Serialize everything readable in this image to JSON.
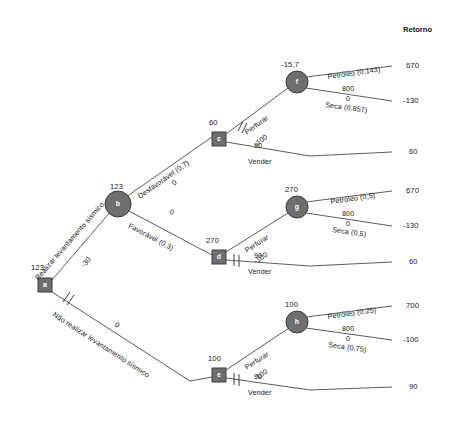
{
  "header": {
    "returns_label": "Retorno"
  },
  "nodes": [
    {
      "id": "a",
      "letter": "a",
      "type": "decision",
      "value": "123",
      "x": 45,
      "y": 285
    },
    {
      "id": "b",
      "letter": "b",
      "type": "chance",
      "value": "123",
      "x": 118,
      "y": 204
    },
    {
      "id": "c",
      "letter": "c",
      "type": "decision",
      "value": "60",
      "x": 219,
      "y": 139
    },
    {
      "id": "d",
      "letter": "d",
      "type": "decision",
      "value": "270",
      "x": 219,
      "y": 257
    },
    {
      "id": "e",
      "letter": "e",
      "type": "decision",
      "value": "100",
      "x": 219,
      "y": 375
    },
    {
      "id": "f",
      "letter": "f",
      "type": "chance",
      "value": "-15,7",
      "x": 297,
      "y": 82
    },
    {
      "id": "g",
      "letter": "g",
      "type": "chance",
      "value": "270",
      "x": 297,
      "y": 207
    },
    {
      "id": "h",
      "letter": "h",
      "type": "chance",
      "value": "100",
      "x": 297,
      "y": 322
    }
  ],
  "branches": [
    {
      "id": "a-b",
      "label": "Realizar levantamento sísmico",
      "cost": "-30",
      "pruned": false
    },
    {
      "id": "a-e",
      "label": "Não realizar levantamento sísmico",
      "cost": "0",
      "pruned": true
    },
    {
      "id": "b-c",
      "label": "Desfavorável (0,7)",
      "cost": "0",
      "pruned": false
    },
    {
      "id": "b-d",
      "label": "Favorável (0,3)",
      "cost": "0",
      "pruned": false
    },
    {
      "id": "c-f",
      "label": "Perfurar",
      "cost": "-100",
      "pruned": true
    },
    {
      "id": "c-t3",
      "label": "Vender",
      "cost": "90",
      "pruned": false
    },
    {
      "id": "d-g",
      "label": "Perfurar",
      "cost": "-100",
      "pruned": false
    },
    {
      "id": "d-t6",
      "label": "Vender",
      "cost": "90",
      "pruned": true
    },
    {
      "id": "e-h",
      "label": "Perfurar",
      "cost": "-100",
      "pruned": false
    },
    {
      "id": "e-t9",
      "label": "Vender",
      "cost": "90",
      "pruned": true
    },
    {
      "id": "f-oil",
      "label": "Petróleo (0,143)",
      "cost": "800",
      "pruned": false
    },
    {
      "id": "f-dry",
      "label": "Seca (0,857)",
      "cost": "0",
      "pruned": false
    },
    {
      "id": "g-oil",
      "label": "Petróleo (0,5)",
      "cost": "800",
      "pruned": false
    },
    {
      "id": "g-dry",
      "label": "Seca (0,5)",
      "cost": "0",
      "pruned": false
    },
    {
      "id": "h-oil",
      "label": "Petróleo (0,25)",
      "cost": "800",
      "pruned": false
    },
    {
      "id": "h-dry",
      "label": "Seca (0,75)",
      "cost": "0",
      "pruned": false
    }
  ],
  "payoffs": [
    {
      "id": "p1",
      "value": "670",
      "y": 67
    },
    {
      "id": "p2",
      "value": "-130",
      "y": 102
    },
    {
      "id": "p3",
      "value": "60",
      "y": 153
    },
    {
      "id": "p4",
      "value": "670",
      "y": 192
    },
    {
      "id": "p5",
      "value": "-130",
      "y": 227
    },
    {
      "id": "p6",
      "value": "60",
      "y": 263
    },
    {
      "id": "p7",
      "value": "700",
      "y": 307
    },
    {
      "id": "p8",
      "value": "-100",
      "y": 341
    },
    {
      "id": "p9",
      "value": "90",
      "y": 388
    }
  ],
  "colors": {
    "node_fill": "#6e6e6e",
    "node_stroke": "#3c3c3c",
    "line": "#4a4a4a",
    "text": "#161616"
  }
}
